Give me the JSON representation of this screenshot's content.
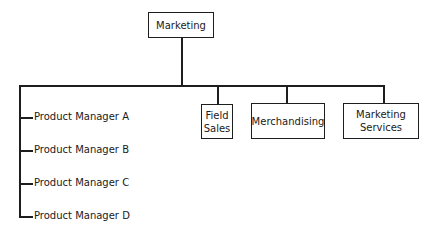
{
  "diagram": {
    "type": "organization-chart",
    "root": {
      "label": "Marketing"
    },
    "departments": [
      {
        "label_line1": "Field",
        "label_line2": "Sales"
      },
      {
        "label_line1": "Merchandising",
        "label_line2": ""
      },
      {
        "label_line1": "Marketing",
        "label_line2": "Services"
      }
    ],
    "product_managers": [
      {
        "label": "Product Manager A"
      },
      {
        "label": "Product Manager B"
      },
      {
        "label": "Product Manager C"
      },
      {
        "label": "Product Manager D"
      }
    ],
    "colors": {
      "line": "#1e1e1e",
      "text": "#1a1a1a",
      "background": "#ffffff"
    }
  }
}
